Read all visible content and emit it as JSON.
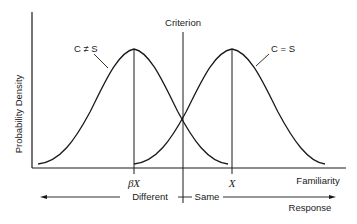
{
  "diagram": {
    "type": "signal-detection-distributions",
    "y_axis_label": "Probability Density",
    "x_axis_label": "Familiarity",
    "curves": [
      {
        "label": "C ≠ S",
        "peak_label": "βX",
        "peak_x": 134,
        "description": "distribution when comparison differs from standard"
      },
      {
        "label": "C = S",
        "peak_label": "X",
        "peak_x": 232,
        "description": "distribution when comparison equals standard"
      }
    ],
    "criterion_label": "Criterion",
    "response_axis": {
      "left_label": "Different",
      "right_label": "Same",
      "title": "Response"
    },
    "colors": {
      "ink": "#1a1a1a",
      "background": "#ffffff"
    }
  }
}
